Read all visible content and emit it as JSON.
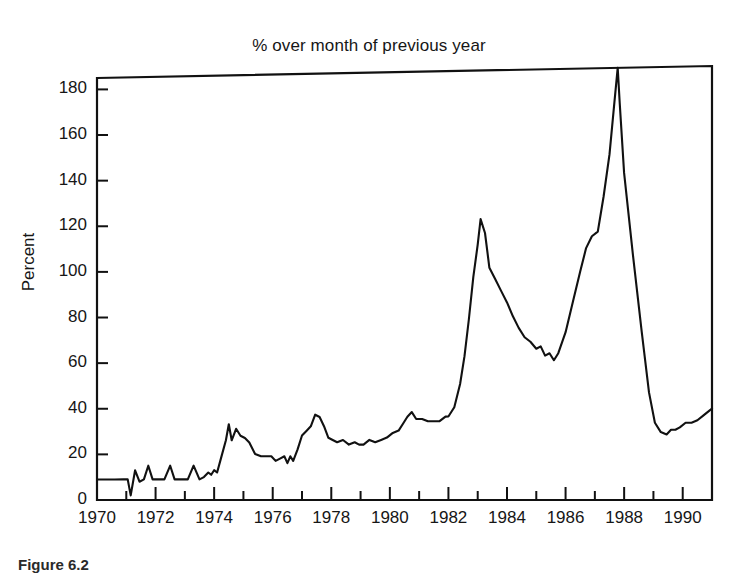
{
  "figure": {
    "caption": "Figure 6.2"
  },
  "chart_data": {
    "type": "line",
    "title": "% over month of previous year",
    "xlabel": "",
    "ylabel": "Percent",
    "xlim": [
      1970,
      1991
    ],
    "ylim": [
      0,
      185
    ],
    "grid": false,
    "legend": null,
    "y_ticks": [
      0,
      20,
      40,
      60,
      80,
      100,
      120,
      140,
      160,
      180
    ],
    "y_tick_labels": [
      "0",
      "20",
      "40",
      "60",
      "80",
      "100",
      "120",
      "140",
      "160",
      "180"
    ],
    "x_ticks": [
      1970,
      1972,
      1974,
      1976,
      1978,
      1980,
      1982,
      1984,
      1986,
      1988,
      1990
    ],
    "x_tick_labels": [
      "1970",
      "1972",
      "1974",
      "1976",
      "1978",
      "1980",
      "1982",
      "1984",
      "1986",
      "1988",
      "1990"
    ],
    "x_minor_tick_step": 1,
    "line_color": "#111111",
    "line_width": 2.1,
    "series": [
      {
        "name": "% over month of previous year",
        "x": [
          1970.0,
          1970.3,
          1970.6,
          1970.9,
          1971.05,
          1971.15,
          1971.3,
          1971.45,
          1971.6,
          1971.75,
          1971.9,
          1972.1,
          1972.3,
          1972.5,
          1972.65,
          1972.8,
          1972.95,
          1973.1,
          1973.3,
          1973.5,
          1973.65,
          1973.8,
          1973.9,
          1974.0,
          1974.1,
          1974.25,
          1974.4,
          1974.5,
          1974.6,
          1974.75,
          1974.9,
          1975.05,
          1975.2,
          1975.4,
          1975.6,
          1975.8,
          1975.95,
          1976.1,
          1976.25,
          1976.4,
          1976.5,
          1976.6,
          1976.7,
          1976.85,
          1977.0,
          1977.15,
          1977.3,
          1977.45,
          1977.6,
          1977.75,
          1977.9,
          1978.05,
          1978.2,
          1978.4,
          1978.6,
          1978.8,
          1978.95,
          1979.1,
          1979.3,
          1979.5,
          1979.7,
          1979.9,
          1980.1,
          1980.3,
          1980.45,
          1980.6,
          1980.75,
          1980.9,
          1981.1,
          1981.3,
          1981.5,
          1981.7,
          1981.9,
          1982.0,
          1982.2,
          1982.4,
          1982.55,
          1982.7,
          1982.85,
          1983.0,
          1983.1,
          1983.25,
          1983.4,
          1983.6,
          1983.8,
          1984.0,
          1984.2,
          1984.4,
          1984.6,
          1984.8,
          1985.0,
          1985.15,
          1985.3,
          1985.45,
          1985.6,
          1985.75,
          1986.0,
          1986.25,
          1986.5,
          1986.7,
          1986.9,
          1987.1,
          1987.3,
          1987.5,
          1987.65,
          1987.78,
          1987.85,
          1988.0,
          1988.3,
          1988.6,
          1988.85,
          1989.05,
          1989.25,
          1989.45,
          1989.6,
          1989.75,
          1989.9,
          1990.1,
          1990.3,
          1990.5,
          1990.7,
          1990.9,
          1991.0
        ],
        "y": [
          9,
          9,
          9,
          9,
          9,
          2,
          13,
          8,
          9,
          15,
          9,
          9,
          9,
          15,
          9,
          9,
          9,
          9,
          15,
          9,
          10,
          12,
          11,
          13,
          12,
          19,
          26,
          33,
          26,
          31,
          28,
          27,
          25,
          20,
          19,
          19,
          19,
          17,
          18,
          19,
          16,
          19,
          17,
          22,
          28,
          30,
          32,
          37,
          36,
          32,
          27,
          26,
          25,
          26,
          24,
          25,
          24,
          24,
          26,
          25,
          26,
          27,
          29,
          30,
          33,
          36,
          38,
          35,
          35,
          34,
          34,
          34,
          36,
          36,
          40,
          50,
          62,
          78,
          96,
          110,
          121,
          115,
          100,
          95,
          90,
          85,
          79,
          74,
          70,
          68,
          65,
          66,
          62,
          63,
          60,
          63,
          72,
          85,
          98,
          108,
          113,
          115,
          130,
          148,
          168,
          185,
          170,
          140,
          105,
          72,
          46,
          33,
          29,
          28,
          30,
          30,
          31,
          33,
          33,
          34,
          36,
          38,
          39
        ]
      }
    ],
    "annotations": [
      {
        "label": "early-1970s plateau",
        "value": 9
      },
      {
        "label": "1974 peak",
        "value": 33
      },
      {
        "label": "1977 peak",
        "value": 37
      },
      {
        "label": "1983 peak",
        "value": 121
      },
      {
        "label": "1985 trough",
        "value": 60
      },
      {
        "label": "1987 peak",
        "value": 185
      },
      {
        "label": "1989 trough",
        "value": 28
      }
    ]
  }
}
